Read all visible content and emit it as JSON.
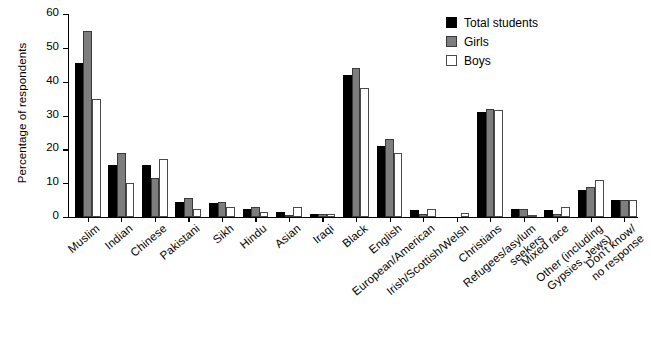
{
  "chart_data": {
    "type": "bar",
    "title": "",
    "xlabel": "",
    "ylabel": "Percentage of respondents",
    "ylim": [
      0,
      60
    ],
    "yticks": [
      0,
      10,
      20,
      30,
      40,
      50,
      60
    ],
    "grid": false,
    "legend_position": "top-right",
    "categories": [
      "Muslim",
      "Indian",
      "Chinese",
      "Pakistani",
      "Sikh",
      "Hindu",
      "Asian",
      "Iraqi",
      "Black",
      "English",
      "European/American",
      "Irish/Scottish/Welsh",
      "Christians",
      "Refugees/asylum\nseekers",
      "Mixed race",
      "Other (including\nGypsies, Jews)",
      "Don't know/\nno response"
    ],
    "series": [
      {
        "name": "Total students",
        "color": "#000000",
        "values": [
          45.5,
          15.5,
          15.5,
          4.5,
          4.0,
          2.5,
          1.5,
          1.0,
          42.0,
          21.0,
          2.0,
          0.0,
          31.0,
          2.5,
          2.0,
          8.0,
          5.0
        ]
      },
      {
        "name": "Girls",
        "color": "#7d7d7d",
        "values": [
          55.0,
          19.0,
          11.5,
          5.5,
          4.5,
          3.0,
          0.5,
          1.0,
          44.0,
          23.0,
          1.0,
          0.0,
          32.0,
          2.5,
          1.0,
          9.0,
          5.0
        ]
      },
      {
        "name": "Boys",
        "color": "#ffffff",
        "values": [
          35.0,
          10.0,
          17.0,
          2.5,
          3.0,
          1.5,
          3.0,
          0.8,
          38.0,
          19.0,
          2.5,
          1.2,
          31.5,
          0.5,
          3.0,
          11.0,
          5.0
        ]
      }
    ]
  },
  "legend": {
    "items": [
      {
        "label": "Total students",
        "swatch": "total"
      },
      {
        "label": "Girls",
        "swatch": "girls"
      },
      {
        "label": "Boys",
        "swatch": "boys"
      }
    ]
  }
}
